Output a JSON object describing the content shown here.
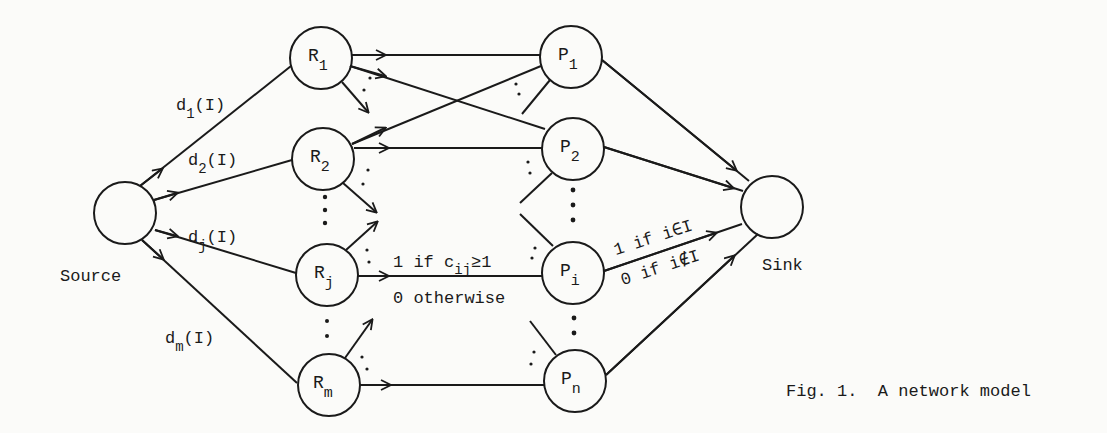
{
  "figure": {
    "caption": "Fig. 1.  A network model",
    "source_label": "Source",
    "sink_label": "Sink"
  },
  "nodes": {
    "source": {
      "label": ""
    },
    "sink": {
      "label": ""
    },
    "resources": [
      {
        "base": "R",
        "sub": "1"
      },
      {
        "base": "R",
        "sub": "2"
      },
      {
        "base": "R",
        "sub": "j"
      },
      {
        "base": "R",
        "sub": "m"
      }
    ],
    "projects": [
      {
        "base": "P",
        "sub": "1"
      },
      {
        "base": "P",
        "sub": "2"
      },
      {
        "base": "P",
        "sub": "i"
      },
      {
        "base": "P",
        "sub": "n"
      }
    ]
  },
  "edge_labels": {
    "source_edges": [
      {
        "base": "d",
        "sub": "1",
        "tail": "(I)"
      },
      {
        "base": "d",
        "sub": "2",
        "tail": "(I)"
      },
      {
        "base": "d",
        "sub": "j",
        "tail": "(I)"
      },
      {
        "base": "d",
        "sub": "m",
        "tail": "(I)"
      }
    ],
    "middle_edge": {
      "line1_pre": "1 if c",
      "line1_sub": "ij",
      "line1_post": "≥1",
      "line2": "0 otherwise"
    },
    "sink_edge": {
      "line1": "1 if i∈I",
      "line2": "0 if i∉I"
    }
  }
}
